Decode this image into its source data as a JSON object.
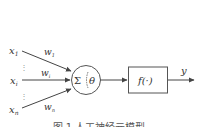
{
  "diagram": {
    "inputs": [
      {
        "label": "x",
        "sub": "1",
        "weight": "w",
        "weight_sub": "1"
      },
      {
        "label": "x",
        "sub": "i",
        "weight": "w",
        "weight_sub": "i"
      },
      {
        "label": "x",
        "sub": "n",
        "weight": "w",
        "weight_sub": "n"
      }
    ],
    "ellipsis": "⋮",
    "summation": {
      "symbol": "Σ",
      "threshold": "θ"
    },
    "activation": {
      "label": "f(·)"
    },
    "output": {
      "label": "y"
    },
    "caption": "图 1  人工神经元模型",
    "colors": {
      "stroke": "#555555",
      "text": "#333333",
      "background": "#ffffff"
    }
  }
}
